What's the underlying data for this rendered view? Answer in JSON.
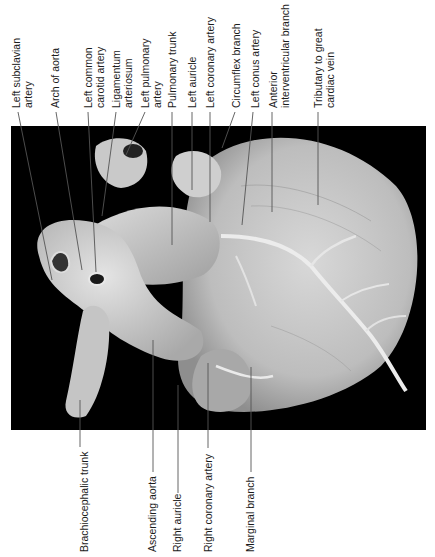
{
  "figure": {
    "background_color": "#000000",
    "label_color": "#1c1c1c",
    "leader_color": "#555555"
  },
  "labels_top": [
    {
      "id": "left-subclavian-artery",
      "lines": [
        "Left subclavian",
        "artery"
      ]
    },
    {
      "id": "arch-of-aorta",
      "lines": [
        "Arch of aorta"
      ]
    },
    {
      "id": "left-common-carotid-artery",
      "lines": [
        "Left common",
        "carotid artery"
      ]
    },
    {
      "id": "ligamentum-arteriosum",
      "lines": [
        "Ligamentum",
        "arteriosum"
      ]
    },
    {
      "id": "left-pulmonary-artery",
      "lines": [
        "Left pulmonary",
        "artery"
      ]
    },
    {
      "id": "pulmonary-trunk",
      "lines": [
        "Pulmonary trunk"
      ]
    },
    {
      "id": "left-auricle",
      "lines": [
        "Left auricle"
      ]
    },
    {
      "id": "left-coronary-artery",
      "lines": [
        "Left coronary artery"
      ]
    },
    {
      "id": "circumflex-branch",
      "lines": [
        "Circumflex branch"
      ]
    },
    {
      "id": "left-conus-artery",
      "lines": [
        "Left conus artery"
      ]
    },
    {
      "id": "anterior-interventricular-branch",
      "lines": [
        "Anterior",
        "interventricular branch"
      ]
    },
    {
      "id": "tributary-to-great-cardiac-vein",
      "lines": [
        "Tributary to great",
        "cardiac vein"
      ]
    }
  ],
  "labels_bottom": [
    {
      "id": "brachiocephalic-trunk",
      "lines": [
        "Brachiocephalic trunk"
      ]
    },
    {
      "id": "ascending-aorta",
      "lines": [
        "Ascending aorta"
      ]
    },
    {
      "id": "right-auricle",
      "lines": [
        "Right auricle"
      ]
    },
    {
      "id": "right-coronary-artery",
      "lines": [
        "Right coronary artery"
      ]
    },
    {
      "id": "marginal-branch",
      "lines": [
        "Marginal branch"
      ]
    }
  ]
}
